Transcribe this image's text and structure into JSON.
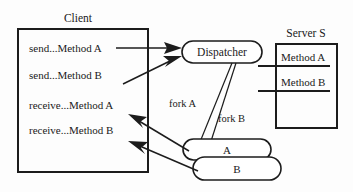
{
  "diagram": {
    "background_color": "#fdfdfd",
    "stroke_color": "#1c1c1c",
    "client": {
      "title": "Client",
      "calls": [
        {
          "label": "send...Method A"
        },
        {
          "label": "send...Method B"
        },
        {
          "label": "receive...Method A"
        },
        {
          "label": "receive...Method B"
        }
      ]
    },
    "dispatcher": {
      "label": "Dispatcher"
    },
    "server": {
      "title": "Server S",
      "methods": [
        {
          "label": "Method A"
        },
        {
          "label": "Method B"
        }
      ]
    },
    "threads": [
      {
        "label": "A"
      },
      {
        "label": "B"
      }
    ],
    "fork_labels": [
      {
        "label": "fork A"
      },
      {
        "label": "fork B"
      }
    ]
  }
}
